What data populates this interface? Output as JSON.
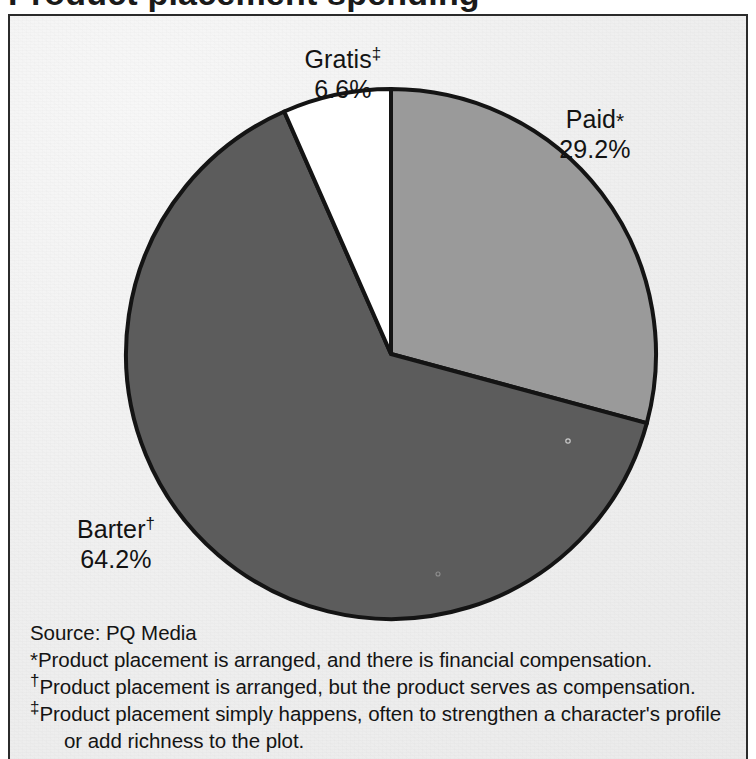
{
  "title_partial": "Product placement spending",
  "chart_data": {
    "type": "pie",
    "title": "",
    "legend_position": "callout",
    "categories": [
      "Paid*",
      "Barter†",
      "Gratis‡"
    ],
    "values": [
      29.2,
      64.2,
      6.6
    ],
    "unit": "%",
    "start_angle_deg": 0,
    "direction": "clockwise",
    "slices": [
      {
        "name": "Paid",
        "marker": "*",
        "value": 29.2,
        "value_label": "29.2%",
        "color": "#9a9a9a"
      },
      {
        "name": "Barter",
        "marker": "†",
        "value": 64.2,
        "value_label": "64.2%",
        "color": "#5c5c5c"
      },
      {
        "name": "Gratis",
        "marker": "‡",
        "value": 6.6,
        "value_label": "6.6%",
        "color": "#ffffff"
      }
    ],
    "source": "Source:  PQ Media",
    "annotations": [
      "*Product placement is arranged, and there is financial compensation.",
      "†Product placement is arranged, but the product serves as compensation.",
      "‡Product placement simply happens, often to strengthen a character's profile or add richness to the plot."
    ]
  },
  "labels": {
    "gratis": {
      "name": "Gratis",
      "marker": "‡",
      "value": "6.6%"
    },
    "paid": {
      "name": "Paid",
      "marker": "*",
      "value": "29.2%"
    },
    "barter": {
      "name": "Barter",
      "marker": "†",
      "value": "64.2%"
    }
  },
  "footnotes": {
    "source": "Source:  PQ Media",
    "line1_sym": "*",
    "line1_text": "Product placement is arranged, and there is financial compensation.",
    "line2_sym": "†",
    "line2_text": "Product placement is arranged, but the product serves as compensation.",
    "line3_sym": "‡",
    "line3_text": "Product placement simply happens, often to strengthen a character's profile",
    "line3_cont": "or add richness to the plot."
  },
  "colors": {
    "paid": "#9a9a9a",
    "barter": "#5c5c5c",
    "gratis": "#ffffff",
    "outline": "#141414",
    "background": "#efefef",
    "text": "#131313"
  }
}
